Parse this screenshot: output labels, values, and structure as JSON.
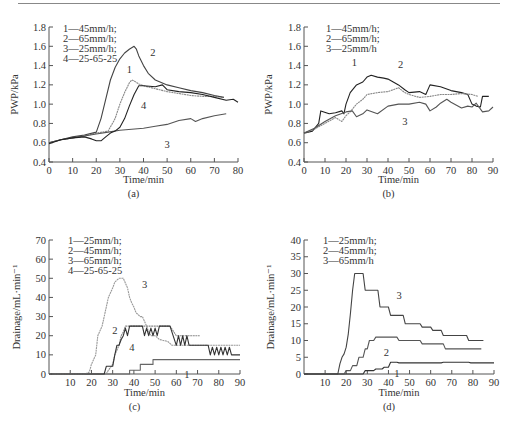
{
  "chart_data": [
    {
      "id": "a",
      "type": "line",
      "panel_label": "(a)",
      "title": "",
      "xlabel": "Time/min",
      "ylabel": "PWP/kPa",
      "xlim": [
        0,
        80
      ],
      "ylim": [
        0.4,
        1.8
      ],
      "xticks": [
        0,
        10,
        20,
        30,
        40,
        50,
        60,
        70,
        80
      ],
      "yticks": [
        0.4,
        0.6,
        0.8,
        1.0,
        1.2,
        1.4,
        1.6,
        1.8
      ],
      "ytick_labels": [
        "0.4",
        "0.6",
        "0.8",
        "1.0",
        "1.2",
        "1.4",
        "1.6",
        "1.8"
      ],
      "grid": false,
      "legend_position": "top-left",
      "legend": [
        "1—45mm/h;",
        "2—65mm/h;",
        "3—25mm/h;",
        "4—25-65-25"
      ],
      "series": [
        {
          "name": "1",
          "label": "45mm/h",
          "color": "#888888",
          "x": [
            0,
            5,
            10,
            15,
            20,
            25,
            28,
            30,
            32,
            34,
            35,
            36,
            38,
            40,
            45,
            50,
            55,
            60,
            65,
            70,
            74
          ],
          "y": [
            0.6,
            0.63,
            0.65,
            0.67,
            0.7,
            0.72,
            0.85,
            1.0,
            1.12,
            1.22,
            1.25,
            1.24,
            1.21,
            1.19,
            1.16,
            1.13,
            1.11,
            1.09,
            1.08,
            1.08,
            1.07
          ],
          "label_at": [
            34,
            1.32
          ]
        },
        {
          "name": "2",
          "label": "65mm/h",
          "color": "#444444",
          "x": [
            0,
            5,
            10,
            15,
            20,
            22,
            24,
            26,
            28,
            30,
            32,
            34,
            36,
            37,
            38,
            40,
            42,
            45,
            50,
            55,
            60,
            65,
            70,
            74
          ],
          "y": [
            0.6,
            0.63,
            0.66,
            0.68,
            0.71,
            0.85,
            1.05,
            1.25,
            1.38,
            1.47,
            1.53,
            1.57,
            1.6,
            1.57,
            1.5,
            1.4,
            1.32,
            1.25,
            1.2,
            1.17,
            1.14,
            1.12,
            1.09,
            1.07
          ],
          "label_at": [
            44,
            1.5
          ]
        },
        {
          "name": "3",
          "label": "25mm/h",
          "color": "#555555",
          "x": [
            0,
            5,
            10,
            15,
            20,
            25,
            30,
            35,
            40,
            45,
            50,
            55,
            60,
            62,
            65,
            70,
            75
          ],
          "y": [
            0.6,
            0.63,
            0.65,
            0.67,
            0.69,
            0.71,
            0.73,
            0.74,
            0.75,
            0.77,
            0.79,
            0.83,
            0.85,
            0.82,
            0.85,
            0.88,
            0.9
          ],
          "label_at": [
            50,
            0.55
          ]
        },
        {
          "name": "4",
          "label": "25-65-25",
          "color": "#222222",
          "x": [
            0,
            5,
            10,
            15,
            18,
            20,
            22,
            24,
            26,
            28,
            30,
            32,
            34,
            36,
            38,
            40,
            45,
            48,
            50,
            55,
            60,
            65,
            70,
            75,
            78,
            80
          ],
          "y": [
            0.59,
            0.63,
            0.65,
            0.66,
            0.64,
            0.62,
            0.62,
            0.66,
            0.7,
            0.72,
            0.76,
            0.85,
            0.98,
            1.1,
            1.19,
            1.19,
            1.18,
            1.2,
            1.15,
            1.13,
            1.12,
            1.1,
            1.07,
            1.04,
            1.05,
            1.02
          ],
          "label_at": [
            40,
            0.95
          ]
        }
      ]
    },
    {
      "id": "b",
      "type": "line",
      "panel_label": "(b)",
      "title": "",
      "xlabel": "Time/min",
      "ylabel": "PWP/kPa",
      "xlim": [
        0,
        90
      ],
      "ylim": [
        0.4,
        1.8
      ],
      "xticks": [
        0,
        10,
        20,
        30,
        40,
        50,
        60,
        70,
        80,
        90
      ],
      "yticks": [
        0.4,
        0.6,
        0.8,
        1.0,
        1.2,
        1.4,
        1.6,
        1.8
      ],
      "ytick_labels": [
        "0.4",
        "0.6",
        "0.8",
        "1.0",
        "1.2",
        "1.4",
        "1.6",
        "1.8"
      ],
      "grid": false,
      "legend_position": "top-left",
      "legend": [
        "1—45mm/h;",
        "2—65mm/h;",
        "3—25mm/h"
      ],
      "series": [
        {
          "name": "1",
          "label": "45mm/h",
          "color": "#222222",
          "x": [
            0,
            4,
            7,
            8,
            12,
            15,
            18,
            19,
            20,
            22,
            25,
            28,
            30,
            32,
            35,
            38,
            40,
            45,
            48,
            50,
            55,
            58,
            60,
            65,
            70,
            75,
            78,
            80,
            82,
            84,
            85,
            88
          ],
          "y": [
            0.7,
            0.72,
            0.8,
            0.93,
            0.9,
            0.91,
            0.93,
            0.9,
            1.0,
            1.12,
            1.2,
            1.23,
            1.28,
            1.3,
            1.28,
            1.27,
            1.26,
            1.2,
            1.15,
            1.12,
            1.13,
            1.1,
            1.2,
            1.18,
            1.14,
            1.12,
            1.1,
            1.0,
            0.98,
            0.97,
            1.08,
            1.08
          ],
          "label_at": [
            24,
            1.4
          ]
        },
        {
          "name": "2",
          "label": "65mm/h",
          "color": "#888888",
          "x": [
            0,
            5,
            10,
            15,
            18,
            20,
            22,
            25,
            28,
            30,
            35,
            40,
            45,
            48,
            50,
            55,
            60,
            65,
            70,
            75,
            80,
            83
          ],
          "y": [
            0.7,
            0.74,
            0.8,
            0.86,
            0.82,
            0.88,
            0.92,
            1.0,
            1.05,
            1.1,
            1.12,
            1.13,
            1.17,
            1.12,
            1.1,
            1.07,
            1.08,
            1.1,
            1.1,
            1.11,
            1.1,
            1.08
          ],
          "label_at": [
            46,
            1.38
          ]
        },
        {
          "name": "3",
          "label": "25mm/h",
          "color": "#555555",
          "x": [
            0,
            5,
            10,
            15,
            20,
            23,
            25,
            28,
            30,
            35,
            40,
            45,
            50,
            55,
            58,
            60,
            63,
            65,
            68,
            70,
            75,
            78,
            80,
            82,
            85,
            88,
            90
          ],
          "y": [
            0.7,
            0.75,
            0.82,
            0.88,
            0.92,
            0.93,
            0.87,
            0.9,
            0.94,
            0.9,
            0.98,
            1.0,
            1.0,
            1.02,
            1.0,
            0.93,
            0.97,
            1.01,
            1.05,
            1.02,
            0.96,
            0.98,
            0.97,
            1.01,
            0.92,
            0.93,
            0.97
          ],
          "label_at": [
            48,
            0.78
          ]
        }
      ]
    },
    {
      "id": "c",
      "type": "line",
      "panel_label": "(c)",
      "title": "",
      "xlabel": "Time/min",
      "ylabel": "Drainage/mL·min⁻¹",
      "xlim": [
        0,
        90
      ],
      "ylim": [
        0,
        70
      ],
      "xticks": [
        10,
        20,
        30,
        40,
        50,
        60,
        70,
        80,
        90
      ],
      "yticks": [
        0,
        10,
        20,
        30,
        40,
        50,
        60,
        70
      ],
      "ytick_labels": [
        "0",
        "10",
        "20",
        "30",
        "40",
        "50",
        "60",
        "70"
      ],
      "grid": false,
      "legend_position": "top-left",
      "legend": [
        "1—25mm/h;",
        "2—45mm/h;",
        "3—65mm/h;",
        "4—25-65-25"
      ],
      "series": [
        {
          "name": "1",
          "label": "25mm/h",
          "color": "#666666",
          "x": [
            0,
            38,
            38,
            43,
            43,
            49,
            49,
            90
          ],
          "y": [
            0,
            0,
            2,
            2,
            5,
            5,
            7.5,
            7.5
          ],
          "label_at": [
            65,
            -2
          ]
        },
        {
          "name": "2",
          "label": "45mm/h",
          "color": "#888888",
          "x": [
            0,
            27,
            28,
            30,
            31,
            33,
            34,
            35,
            36,
            37,
            38,
            57,
            60,
            71
          ],
          "y": [
            0,
            0,
            2,
            5,
            10,
            15,
            20,
            22,
            25,
            25,
            25,
            25,
            20,
            20
          ],
          "label_at": [
            31,
            21
          ]
        },
        {
          "name": "3",
          "label": "65mm/h",
          "color": "#999999",
          "x": [
            0,
            17,
            19,
            20,
            22,
            23,
            25,
            26,
            27,
            28,
            30,
            31,
            33,
            35,
            37,
            38,
            39,
            40,
            41,
            43,
            44,
            46,
            47,
            48,
            50,
            52,
            56,
            58,
            90
          ],
          "y": [
            0,
            0,
            1,
            5,
            10,
            20,
            25,
            30,
            35,
            40,
            45,
            48,
            50,
            50,
            45,
            40,
            37,
            35,
            32,
            30,
            30,
            25,
            22,
            20,
            20,
            18,
            17,
            15,
            15
          ],
          "label_at": [
            45,
            45
          ]
        },
        {
          "name": "4",
          "label": "25-65-25",
          "color": "#333333",
          "x": [
            0,
            26,
            27,
            30,
            31,
            32,
            33,
            34,
            35,
            36,
            37,
            38,
            44,
            45,
            46,
            47,
            48,
            49,
            50,
            51,
            52,
            57,
            60,
            61,
            62,
            63,
            64,
            65,
            66,
            75,
            76,
            77,
            78,
            79,
            80,
            81,
            82,
            83,
            84,
            85,
            86,
            90
          ],
          "y": [
            0,
            0,
            4,
            4,
            10,
            15,
            15,
            18,
            20,
            24,
            20,
            25,
            25,
            20,
            24,
            20,
            24,
            20,
            24,
            20,
            25,
            25,
            15,
            20,
            15,
            20,
            15,
            20,
            15,
            15,
            10,
            14,
            10,
            14,
            10,
            14,
            10,
            14,
            10,
            14,
            10,
            10
          ],
          "label_at": [
            39,
            12
          ]
        }
      ]
    },
    {
      "id": "d",
      "type": "line",
      "panel_label": "(d)",
      "title": "",
      "xlabel": "Time/min",
      "ylabel": "Drainage/mL·min⁻¹",
      "xlim": [
        0,
        90
      ],
      "ylim": [
        0,
        40
      ],
      "xticks": [
        10,
        20,
        30,
        40,
        50,
        60,
        70,
        80,
        90
      ],
      "yticks": [
        0,
        5,
        10,
        15,
        20,
        25,
        30,
        35,
        40
      ],
      "ytick_labels": [
        "0",
        "5",
        "10",
        "15",
        "20",
        "25",
        "30",
        "35",
        "40"
      ],
      "grid": false,
      "legend_position": "top-left",
      "legend": [
        "1—25mm/h;",
        "2—45mm/h;",
        "3—65mm/h"
      ],
      "series": [
        {
          "name": "1",
          "label": "25mm/h",
          "color": "#333333",
          "x": [
            0,
            28,
            29,
            33,
            34,
            37,
            38,
            40,
            41,
            44,
            45,
            65,
            66,
            78,
            79,
            90
          ],
          "y": [
            0,
            0,
            1,
            1,
            1.5,
            1.5,
            2,
            2,
            3.5,
            3.5,
            3.3,
            3.3,
            3.5,
            3.5,
            3.3,
            3.3
          ],
          "label_at": [
            44,
            -1
          ]
        },
        {
          "name": "2",
          "label": "45mm/h",
          "color": "#555555",
          "x": [
            0,
            19,
            20,
            22,
            23,
            25,
            26,
            28,
            29,
            30,
            31,
            33,
            34,
            44,
            45,
            55,
            56,
            66,
            67,
            84
          ],
          "y": [
            0,
            0,
            1,
            1,
            2.5,
            2.5,
            5,
            5,
            7.5,
            7.5,
            10,
            10,
            11,
            11,
            10,
            10,
            9,
            9,
            7.5,
            7.5
          ],
          "label_at": [
            39,
            5.5
          ]
        },
        {
          "name": "3",
          "label": "65mm/h",
          "color": "#444444",
          "x": [
            0,
            16,
            17,
            18,
            19,
            20,
            21,
            22,
            23,
            24,
            28,
            29,
            35,
            36,
            40,
            41,
            47,
            48,
            55,
            56,
            60,
            61,
            65,
            66,
            70,
            71,
            77,
            78,
            85
          ],
          "y": [
            0,
            0,
            3,
            5,
            6,
            8,
            12,
            18,
            25,
            30,
            30,
            25,
            25,
            20,
            20,
            17.5,
            17.5,
            15,
            15,
            14,
            14,
            13,
            13,
            11.5,
            11.5,
            11.5,
            11.5,
            10,
            10
          ],
          "label_at": [
            45,
            22.5
          ]
        }
      ]
    }
  ]
}
